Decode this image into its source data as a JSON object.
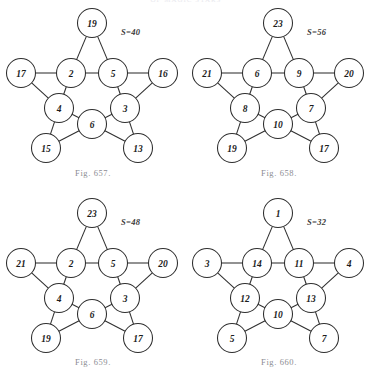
{
  "page": {
    "running_head": "OF MAGIC STARS",
    "background_color": "#ffffff",
    "ink_color": "#2e2e2e",
    "caption_color": "#8c8c92"
  },
  "figures": [
    {
      "id": "fig-657",
      "caption": "Fig. 657.",
      "sum_label": "S=40",
      "sum_value": 40,
      "nodes": {
        "outer_top": "19",
        "outer_left": "17",
        "outer_right": "16",
        "outer_lower_left": "15",
        "outer_lower_right": "13",
        "inner_upper_left": "2",
        "inner_upper_right": "5",
        "inner_left": "4",
        "inner_right": "3",
        "inner_bottom": "6"
      }
    },
    {
      "id": "fig-658",
      "caption": "Fig. 658.",
      "sum_label": "S=56",
      "sum_value": 56,
      "nodes": {
        "outer_top": "23",
        "outer_left": "21",
        "outer_right": "20",
        "outer_lower_left": "19",
        "outer_lower_right": "17",
        "inner_upper_left": "6",
        "inner_upper_right": "9",
        "inner_left": "8",
        "inner_right": "7",
        "inner_bottom": "10"
      }
    },
    {
      "id": "fig-659",
      "caption": "Fig. 659.",
      "sum_label": "S=48",
      "sum_value": 48,
      "nodes": {
        "outer_top": "23",
        "outer_left": "21",
        "outer_right": "20",
        "outer_lower_left": "19",
        "outer_lower_right": "17",
        "inner_upper_left": "2",
        "inner_upper_right": "5",
        "inner_left": "4",
        "inner_right": "3",
        "inner_bottom": "6"
      }
    },
    {
      "id": "fig-660",
      "caption": "Fig. 660.",
      "sum_label": "S=32",
      "sum_value": 32,
      "nodes": {
        "outer_top": "1",
        "outer_left": "3",
        "outer_right": "4",
        "outer_lower_left": "5",
        "outer_lower_right": "7",
        "inner_upper_left": "14",
        "inner_upper_right": "11",
        "inner_left": "12",
        "inner_right": "13",
        "inner_bottom": "10"
      }
    }
  ]
}
